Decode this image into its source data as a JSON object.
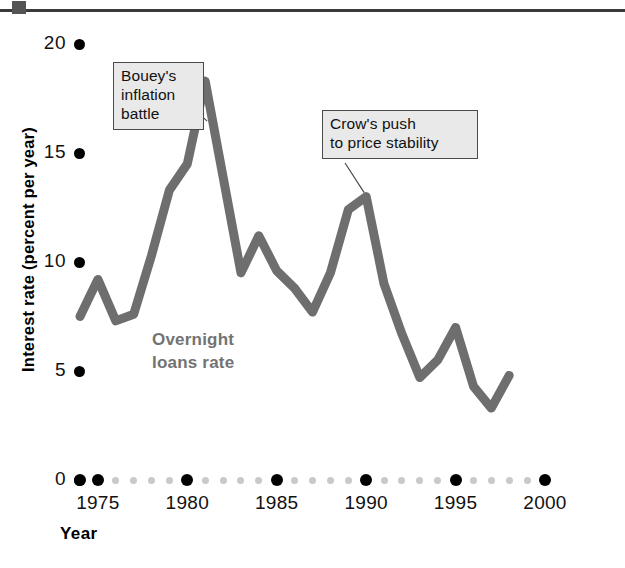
{
  "figure": {
    "top_rule": "header-rule"
  },
  "axes": {
    "y_title": "Interest rate (percent per year)",
    "y_ticks": [
      {
        "label": "20",
        "value": 20
      },
      {
        "label": "15",
        "value": 15
      },
      {
        "label": "10",
        "value": 10
      },
      {
        "label": "5",
        "value": 5
      },
      {
        "label": "0",
        "value": 0
      }
    ],
    "x_title": "Year",
    "x_ticks": [
      {
        "label": "1975",
        "value": 1975
      },
      {
        "label": "1980",
        "value": 1980
      },
      {
        "label": "1985",
        "value": 1985
      },
      {
        "label": "1990",
        "value": 1990
      },
      {
        "label": "1995",
        "value": 1995
      },
      {
        "label": "2000",
        "value": 2000
      }
    ]
  },
  "series_label": {
    "line1": "Overnight",
    "line2": "loans rate"
  },
  "annotations": [
    {
      "id": "bouey",
      "line1": "Bouey's",
      "line2": "inflation",
      "line3": "battle",
      "target_year": 1981,
      "target_value": 18.3
    },
    {
      "id": "crow",
      "line1": "Crow's push",
      "line2": "to price stability",
      "target_year": 1990,
      "target_value": 13.0
    }
  ],
  "colors": {
    "line": "#6e6e6e",
    "series_label": "#737373",
    "callout_fill": "#e9e9e9",
    "callout_border": "#4a4a4a",
    "major_dot": "#000000",
    "minor_dot": "#c9c9c9",
    "rule": "#3a3a3a"
  },
  "chart_data": {
    "type": "line",
    "title": "",
    "xlabel": "Year",
    "ylabel": "Interest rate (percent per year)",
    "xlim": [
      1974,
      2000
    ],
    "ylim": [
      0,
      20
    ],
    "grid": false,
    "legend": "inline-label",
    "series": [
      {
        "name": "Overnight loans rate",
        "color": "#6e6e6e",
        "x": [
          1974,
          1975,
          1976,
          1977,
          1978,
          1979,
          1980,
          1981,
          1982,
          1983,
          1984,
          1985,
          1986,
          1987,
          1988,
          1989,
          1990,
          1991,
          1992,
          1993,
          1994,
          1995,
          1996,
          1997,
          1998
        ],
        "y": [
          7.5,
          9.2,
          7.3,
          7.6,
          10.3,
          13.3,
          14.5,
          18.3,
          13.9,
          9.5,
          11.2,
          9.6,
          8.8,
          7.7,
          9.5,
          12.4,
          13.0,
          9.0,
          6.7,
          4.7,
          5.5,
          7.0,
          4.3,
          3.3,
          4.8
        ]
      }
    ],
    "annotations": [
      {
        "text": "Bouey's inflation battle",
        "points_to": {
          "x": 1981,
          "y": 18.3
        }
      },
      {
        "text": "Crow's push to price stability",
        "points_to": {
          "x": 1990,
          "y": 13.0
        }
      }
    ],
    "x_major_ticks": [
      1975,
      1980,
      1985,
      1990,
      1995,
      2000
    ],
    "y_major_ticks": [
      0,
      5,
      10,
      15,
      20
    ]
  }
}
